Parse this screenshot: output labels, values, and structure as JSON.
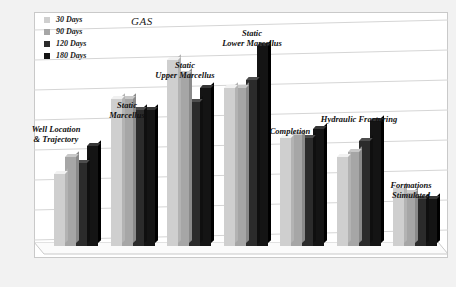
{
  "chart_data": {
    "type": "bar",
    "title": "GAS",
    "xlabel": "",
    "ylabel": "",
    "ylim": [
      0,
      8
    ],
    "grid": true,
    "legend_position": "top-left",
    "categories": [
      "Well Location\n& Trajectory",
      "Static\nMarcellus",
      "Static\nUpper Marcellus",
      "Static\nLower Marcellus",
      "Completion",
      "Hydraulic Fracturing",
      "Formations\nStimulated"
    ],
    "series": [
      {
        "name": "30 Days",
        "color": "#cfcfcf",
        "values": [
          2.6,
          5.3,
          6.7,
          5.7,
          3.9,
          3.2,
          2.1
        ]
      },
      {
        "name": "90 Days",
        "color": "#a6a6a6",
        "values": [
          3.2,
          5.3,
          6.2,
          5.7,
          4.0,
          3.4,
          1.9
        ]
      },
      {
        "name": "120 Days",
        "color": "#2b2b2b",
        "values": [
          3.0,
          4.9,
          5.2,
          6.0,
          3.9,
          3.8,
          1.7
        ]
      },
      {
        "name": "180 Days",
        "color": "#141414",
        "values": [
          3.6,
          4.9,
          5.7,
          7.2,
          4.2,
          4.5,
          1.7
        ]
      }
    ],
    "gridline_count": 8
  },
  "legend": {
    "items": [
      {
        "label": "30 Days",
        "color": "#cfcfcf"
      },
      {
        "label": "90 Days",
        "color": "#a6a6a6"
      },
      {
        "label": "120 Days",
        "color": "#2b2b2b"
      },
      {
        "label": "180 Days",
        "color": "#141414"
      }
    ]
  },
  "colors": {
    "background": "#f2f2f2",
    "plot_background": "#ffffff",
    "gridline": "#d0d0d0",
    "border": "#c9c9c9"
  }
}
